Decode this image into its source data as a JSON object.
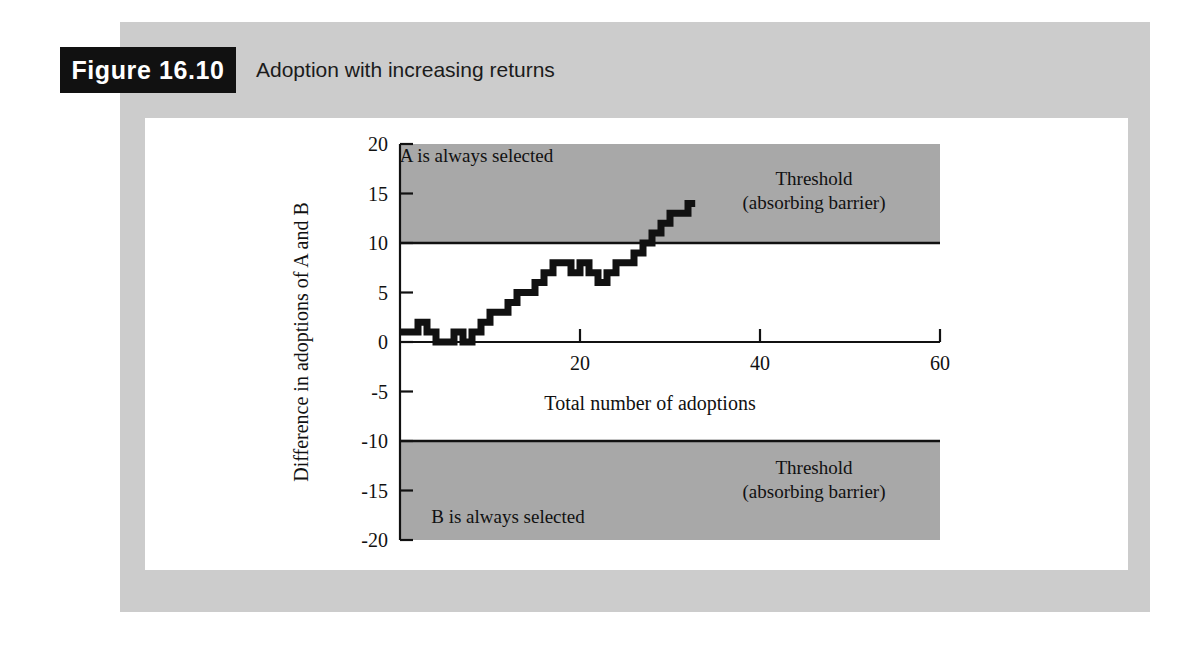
{
  "figure": {
    "label": "Figure 16.10",
    "title": "Adoption with increasing returns"
  },
  "colors": {
    "page_background": "#ffffff",
    "gray_band": "#cccccc",
    "panel": "#ffffff",
    "shaded_region": "#a8a8a8",
    "ink": "#111111",
    "label_box": "#111111",
    "label_text": "#ffffff"
  },
  "chart_data": {
    "type": "line",
    "title": "Adoption with increasing returns",
    "xlabel": "Total number of adoptions",
    "ylabel": "Difference in adoptions of A and B",
    "xlim": [
      0,
      60
    ],
    "ylim": [
      -20,
      20
    ],
    "grid": false,
    "legend": "none",
    "step_style": "post",
    "xticks": [
      0,
      20,
      40,
      60
    ],
    "xtick_labels": [
      "0",
      "20",
      "40",
      "60"
    ],
    "yticks": [
      -20,
      -15,
      -10,
      -5,
      0,
      5,
      10,
      15,
      20
    ],
    "ytick_labels": [
      "-20",
      "-15",
      "-10",
      "-5",
      "0",
      "5",
      "10",
      "15",
      "20"
    ],
    "x": [
      0,
      1,
      2,
      3,
      4,
      5,
      6,
      7,
      8,
      9,
      10,
      11,
      12,
      13,
      14,
      15,
      16,
      17,
      18,
      19,
      20,
      21,
      22,
      23,
      24,
      25,
      26,
      27,
      28,
      29,
      30,
      31,
      32
    ],
    "values": [
      1,
      1,
      2,
      1,
      0,
      0,
      1,
      0,
      1,
      2,
      3,
      3,
      4,
      5,
      5,
      6,
      7,
      8,
      8,
      7,
      8,
      7,
      6,
      7,
      8,
      8,
      9,
      10,
      11,
      12,
      13,
      13,
      14
    ],
    "series": [
      {
        "name": "Difference in adoptions of A and B",
        "values": [
          1,
          1,
          2,
          1,
          0,
          0,
          1,
          0,
          1,
          2,
          3,
          3,
          4,
          5,
          5,
          6,
          7,
          8,
          8,
          7,
          8,
          7,
          6,
          7,
          8,
          8,
          9,
          10,
          11,
          12,
          13,
          13,
          14
        ]
      }
    ],
    "shaded_regions": [
      {
        "name": "upper-absorbing-barrier",
        "y_from": 10,
        "y_to": 20,
        "x_from": 0,
        "x_to": 60
      },
      {
        "name": "lower-absorbing-barrier",
        "y_from": -20,
        "y_to": -10,
        "x_from": 0,
        "x_to": 60
      }
    ],
    "annotations": [
      {
        "name": "a-selected-label",
        "text": "A is always selected",
        "x": 8.5,
        "y": 18.2,
        "anchor": "middle"
      },
      {
        "name": "upper-threshold-label-line1",
        "text": "Threshold",
        "x": 46,
        "y": 15.9,
        "anchor": "middle"
      },
      {
        "name": "upper-threshold-label-line2",
        "text": "(absorbing barrier)",
        "x": 46,
        "y": 13.4,
        "anchor": "middle"
      },
      {
        "name": "lower-threshold-label-line1",
        "text": "Threshold",
        "x": 46,
        "y": -13.3,
        "anchor": "middle"
      },
      {
        "name": "lower-threshold-label-line2",
        "text": "(absorbing barrier)",
        "x": 46,
        "y": -15.8,
        "anchor": "middle"
      },
      {
        "name": "b-selected-label",
        "text": "B is always selected",
        "x": 12,
        "y": -18.3,
        "anchor": "middle"
      }
    ]
  }
}
